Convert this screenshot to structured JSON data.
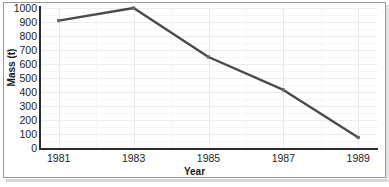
{
  "chart_data": {
    "type": "line",
    "title": "",
    "xlabel": "Year",
    "ylabel": "Mass (t)",
    "x": [
      1981,
      1983,
      1985,
      1987,
      1989
    ],
    "xtick_labels": [
      "1981",
      "1983",
      "1985",
      "1987",
      "1989"
    ],
    "values": [
      910,
      1000,
      650,
      415,
      75
    ],
    "series": [
      {
        "name": "Mass",
        "values": [
          910,
          1000,
          650,
          415,
          75
        ]
      }
    ],
    "ylim": [
      0,
      1000
    ],
    "xlim": [
      1980.5,
      1989.5
    ],
    "ytick_labels": [
      "0",
      "100",
      "200",
      "300",
      "400",
      "500",
      "600",
      "700",
      "800",
      "900",
      "1000"
    ],
    "ytick_values": [
      0,
      100,
      200,
      300,
      400,
      500,
      600,
      700,
      800,
      900,
      1000
    ],
    "grid": true,
    "legend": "none",
    "line_color": "#4a4a4a",
    "marker_color": "#6b6b6b",
    "axis_color": "#2b2b2b",
    "grid_color": "#ececec",
    "background_color": "#ffffff",
    "border_color": "#9a9a9a"
  }
}
